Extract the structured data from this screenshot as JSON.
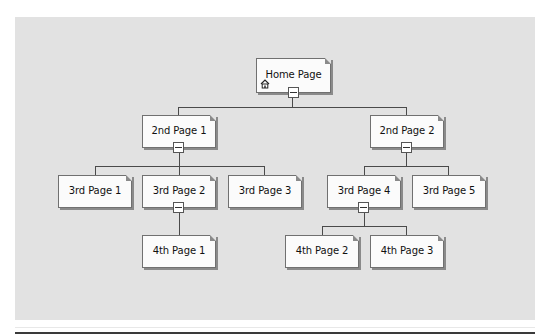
{
  "diagram": {
    "colors": {
      "background": "#e2e2e2",
      "node_fill": "#fbfbfb",
      "node_border": "#707070",
      "connector": "#4a4a4a"
    },
    "nodes": {
      "home": {
        "label": "Home Page",
        "icon": "home-icon",
        "collapsible": true
      },
      "p2_1": {
        "label": "2nd Page 1",
        "collapsible": true
      },
      "p2_2": {
        "label": "2nd Page 2",
        "collapsible": true
      },
      "p3_1": {
        "label": "3rd Page 1",
        "collapsible": false
      },
      "p3_2": {
        "label": "3rd Page 2",
        "collapsible": true
      },
      "p3_3": {
        "label": "3rd Page 3",
        "collapsible": false
      },
      "p3_4": {
        "label": "3rd Page 4",
        "collapsible": true
      },
      "p3_5": {
        "label": "3rd Page 5",
        "collapsible": false
      },
      "p4_1": {
        "label": "4th Page 1",
        "collapsible": false
      },
      "p4_2": {
        "label": "4th Page 2",
        "collapsible": false
      },
      "p4_3": {
        "label": "4th Page 3",
        "collapsible": false
      }
    },
    "edges": [
      [
        "Home Page",
        "2nd Page 1"
      ],
      [
        "Home Page",
        "2nd Page 2"
      ],
      [
        "2nd Page 1",
        "3rd Page 1"
      ],
      [
        "2nd Page 1",
        "3rd Page 2"
      ],
      [
        "2nd Page 1",
        "3rd Page 3"
      ],
      [
        "2nd Page 2",
        "3rd Page 4"
      ],
      [
        "2nd Page 2",
        "3rd Page 5"
      ],
      [
        "3rd Page 2",
        "4th Page 1"
      ],
      [
        "3rd Page 4",
        "4th Page 2"
      ],
      [
        "3rd Page 4",
        "4th Page 3"
      ]
    ]
  }
}
